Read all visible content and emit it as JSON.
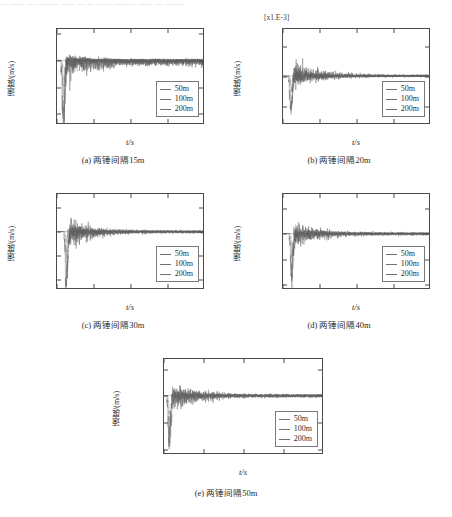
{
  "truncated_header": "— —— — ——— —— — — —— ——— —— — ——— — ——",
  "axes": {
    "ylabel": "速度/(m/s)",
    "xlabel": "t/s"
  },
  "legend": {
    "items": [
      {
        "label": "50m",
        "color": "#6f6f6f"
      },
      {
        "label": "100m",
        "color": "#6f6f6f"
      },
      {
        "label": "200m",
        "color": "#6f6f6f"
      }
    ]
  },
  "chart_data": [
    {
      "type": "line",
      "panel": "a",
      "caption": "(a) 两锤间隔15m",
      "title": "",
      "xlabel": "t/s",
      "ylabel": "速度/(m/s)",
      "exponent_label": "",
      "xlim": [
        0,
        20
      ],
      "ylim": [
        -0.012,
        0.006
      ],
      "xticks": [
        0,
        5,
        10,
        15,
        20
      ],
      "xtick_labels": [
        "0",
        "5",
        "10",
        "15",
        "20"
      ],
      "yticks": [
        0.005,
        0.0,
        -0.005,
        -0.01
      ],
      "ytick_labels": [
        "0.005",
        "0.000",
        "-0.005",
        "-0.010"
      ],
      "grid": false,
      "legend_position": "lower-right",
      "series": [
        {
          "name": "50m",
          "peak_positive": 0.0035,
          "peak_negative": -0.0125,
          "onset_time": 0.6,
          "decay_time": 13.0,
          "rms_tail": 0.0004
        },
        {
          "name": "100m",
          "peak_positive": 0.0028,
          "peak_negative": -0.009,
          "onset_time": 0.7,
          "decay_time": 12.0,
          "rms_tail": 0.0003
        },
        {
          "name": "200m",
          "peak_positive": 0.002,
          "peak_negative": -0.006,
          "onset_time": 0.8,
          "decay_time": 11.0,
          "rms_tail": 0.0002
        }
      ]
    },
    {
      "type": "line",
      "panel": "b",
      "caption": "(b) 两锤间隔20m",
      "title": "",
      "xlabel": "t/s",
      "ylabel": "速度/(m/s)",
      "exponent_label": "[x1.E-3]",
      "xlim": [
        0,
        20
      ],
      "ylim": [
        -8.0,
        8.0
      ],
      "xticks": [
        0,
        5,
        10,
        15,
        20
      ],
      "xtick_labels": [
        "0",
        "5",
        "10",
        "15",
        "20"
      ],
      "yticks": [
        5.0,
        0.0,
        -5.0
      ],
      "ytick_labels": [
        "5.0",
        "0.0",
        "-5.0"
      ],
      "grid": false,
      "legend_position": "lower-right",
      "series": [
        {
          "name": "50m",
          "peak_positive": 7.6,
          "peak_negative": -5.4,
          "onset_time": 0.8,
          "decay_time": 14.0,
          "rms_tail": 0.35
        },
        {
          "name": "100m",
          "peak_positive": 5.0,
          "peak_negative": -4.2,
          "onset_time": 0.9,
          "decay_time": 13.0,
          "rms_tail": 0.28
        },
        {
          "name": "200m",
          "peak_positive": 3.4,
          "peak_negative": -3.0,
          "onset_time": 1.0,
          "decay_time": 12.0,
          "rms_tail": 0.2
        }
      ]
    },
    {
      "type": "line",
      "panel": "c",
      "caption": "(c) 两锤间隔30m",
      "title": "",
      "xlabel": "t/s",
      "ylabel": "速度/(m/s)",
      "exponent_label": "",
      "xlim": [
        0,
        20
      ],
      "ylim": [
        -0.012,
        0.008
      ],
      "xticks": [
        0,
        5,
        10,
        15,
        20
      ],
      "xtick_labels": [
        "0",
        "5",
        "10",
        "15",
        "20"
      ],
      "yticks": [
        0.005,
        0.0,
        -0.005,
        -0.01
      ],
      "ytick_labels": [
        "0.005",
        "0.000",
        "-0.005",
        "-0.010"
      ],
      "grid": false,
      "legend_position": "lower-right",
      "series": [
        {
          "name": "50m",
          "peak_positive": 0.0075,
          "peak_negative": -0.0102,
          "onset_time": 1.0,
          "decay_time": 13.0,
          "rms_tail": 0.0004
        },
        {
          "name": "100m",
          "peak_positive": 0.0055,
          "peak_negative": -0.0075,
          "onset_time": 1.1,
          "decay_time": 12.0,
          "rms_tail": 0.0003
        },
        {
          "name": "200m",
          "peak_positive": 0.0038,
          "peak_negative": -0.005,
          "onset_time": 1.2,
          "decay_time": 11.0,
          "rms_tail": 0.0002
        }
      ]
    },
    {
      "type": "line",
      "panel": "d",
      "caption": "(d) 两锤间隔40m",
      "title": "",
      "xlabel": "t/s",
      "ylabel": "速度/(m/s)",
      "exponent_label": "",
      "xlim": [
        0,
        20
      ],
      "ylim": [
        -0.011,
        0.008
      ],
      "xticks": [
        0,
        5,
        10,
        15,
        20
      ],
      "xtick_labels": [
        "0",
        "5",
        "10",
        "15",
        "20"
      ],
      "yticks": [
        0.005,
        0.0,
        -0.005,
        -0.01
      ],
      "ytick_labels": [
        "0.005",
        "0.000",
        "-0.005",
        "-0.010"
      ],
      "grid": false,
      "legend_position": "lower-right",
      "series": [
        {
          "name": "50m",
          "peak_positive": 0.0058,
          "peak_negative": -0.008,
          "onset_time": 0.9,
          "decay_time": 13.5,
          "rms_tail": 0.0004
        },
        {
          "name": "100m",
          "peak_positive": 0.0042,
          "peak_negative": -0.0058,
          "onset_time": 1.0,
          "decay_time": 12.5,
          "rms_tail": 0.0003
        },
        {
          "name": "200m",
          "peak_positive": 0.003,
          "peak_negative": -0.004,
          "onset_time": 1.1,
          "decay_time": 11.5,
          "rms_tail": 0.0002
        }
      ]
    },
    {
      "type": "line",
      "panel": "e",
      "caption": "(e) 两锤间隔50m",
      "title": "",
      "xlabel": "t/s",
      "ylabel": "速度/(m/s)",
      "exponent_label": "",
      "xlim": [
        0,
        20
      ],
      "ylim": [
        -0.011,
        0.007
      ],
      "xticks": [
        0,
        5,
        10,
        15,
        20
      ],
      "xtick_labels": [
        "0",
        "5",
        "10",
        "15",
        "20"
      ],
      "yticks": [
        0.005,
        0.0,
        -0.005,
        -0.01
      ],
      "ytick_labels": [
        "0.005",
        "0.000",
        "-0.005",
        "-0.010"
      ],
      "grid": false,
      "legend_position": "lower-right",
      "series": [
        {
          "name": "50m",
          "peak_positive": 0.006,
          "peak_negative": -0.0082,
          "onset_time": 0.4,
          "decay_time": 14.0,
          "rms_tail": 0.0004
        },
        {
          "name": "100m",
          "peak_positive": 0.0044,
          "peak_negative": -0.006,
          "onset_time": 0.5,
          "decay_time": 13.0,
          "rms_tail": 0.0003
        },
        {
          "name": "200m",
          "peak_positive": 0.003,
          "peak_negative": -0.0042,
          "onset_time": 0.6,
          "decay_time": 12.0,
          "rms_tail": 0.0002
        }
      ]
    }
  ]
}
